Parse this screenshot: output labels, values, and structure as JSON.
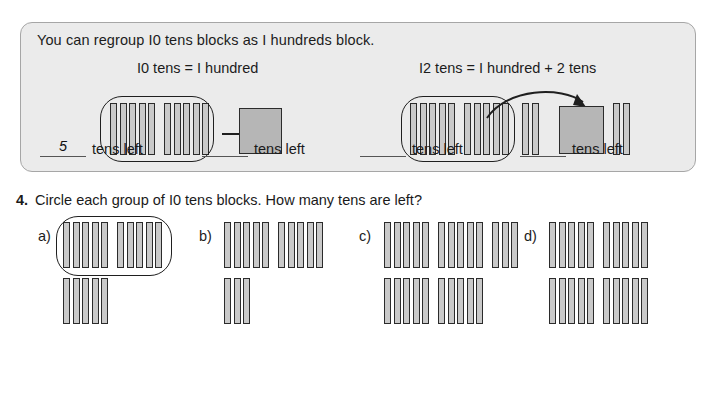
{
  "panel": {
    "title": "You can regroup I0 tens blocks as I hundreds block.",
    "equation_left": "I0 tens = I hundred",
    "equation_right": "I2 tens = I hundred + 2 tens",
    "background_color": "#ebebeb",
    "border_color": "#a6a6a6",
    "left_example": {
      "circled_rod_groups": [
        5,
        5
      ],
      "circled_total": 10,
      "result_label": "hundreds-block",
      "arrow": "straight-right"
    },
    "right_example": {
      "circled_rod_groups": [
        5,
        5
      ],
      "circled_total": 10,
      "extra_rods_before": 2,
      "result_total_tens": 12,
      "trailing_rods": 2,
      "arrow": "curved-right"
    }
  },
  "question": {
    "number": "4.",
    "text": "Circle each group of I0 tens blocks. How many tens are left?"
  },
  "items": [
    {
      "label": "a)",
      "rows": [
        {
          "groups": [
            5,
            5
          ],
          "circled": true
        },
        {
          "groups": [
            5
          ],
          "circled": false
        }
      ],
      "total_tens": 15,
      "answer": "5",
      "answer_suffix": "tens left"
    },
    {
      "label": "b)",
      "rows": [
        {
          "groups": [
            5,
            5
          ],
          "circled": false
        },
        {
          "groups": [
            3
          ],
          "circled": false
        }
      ],
      "total_tens": 13,
      "answer": "",
      "answer_suffix": "tens left"
    },
    {
      "label": "c)",
      "rows": [
        {
          "groups": [
            5,
            5,
            3
          ],
          "circled": false
        },
        {
          "groups": [
            5,
            5
          ],
          "circled": false
        }
      ],
      "total_tens": 23,
      "answer": "",
      "answer_suffix": "tens left"
    },
    {
      "label": "d)",
      "rows": [
        {
          "groups": [
            5,
            5
          ],
          "circled": false
        },
        {
          "groups": [
            5,
            5
          ],
          "circled": false
        }
      ],
      "total_tens": 20,
      "answer": "",
      "answer_suffix": "tens left"
    }
  ],
  "colors": {
    "rod_fill": "#c9c9c9",
    "rod_border": "#2b2b2b",
    "hundred_fill": "#b6b6b6",
    "text": "#1c1c1c"
  }
}
